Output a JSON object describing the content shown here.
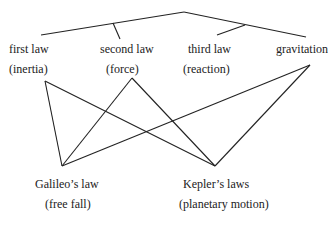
{
  "nodes": {
    "first_law": {
      "title": "first law",
      "sub": "(inertia)"
    },
    "second_law": {
      "title": "second law",
      "sub": "(force)"
    },
    "third_law": {
      "title": "third law",
      "sub": "(reaction)"
    },
    "gravitation": {
      "title": "gravitation"
    },
    "galileo": {
      "title": "Galileo’s law",
      "sub": "(free fall)"
    },
    "kepler": {
      "title": "Kepler’s laws",
      "sub": "(planetary motion)"
    }
  }
}
